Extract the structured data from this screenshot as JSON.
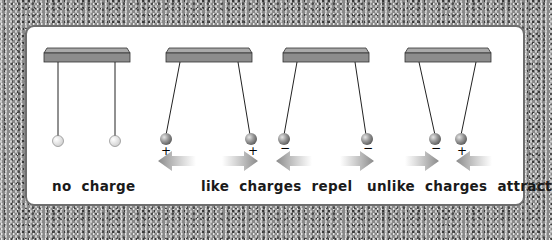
{
  "diagram": {
    "panels": [
      {
        "id": "no-charge",
        "caption": "no charge",
        "balls": [
          {
            "charge": ""
          },
          {
            "charge": ""
          }
        ],
        "arrows": "none"
      },
      {
        "id": "like-charges",
        "balls": [
          {
            "charge": "+"
          },
          {
            "charge": "+"
          }
        ],
        "arrows": "outward"
      },
      {
        "id": "like-charges-negative",
        "balls": [
          {
            "charge": "−"
          },
          {
            "charge": "−"
          }
        ],
        "arrows": "outward"
      },
      {
        "id": "unlike-charges",
        "balls": [
          {
            "charge": "−"
          },
          {
            "charge": "+"
          }
        ],
        "arrows": "inward"
      }
    ],
    "captions": {
      "no_charge": "no charge",
      "like_repel": "like charges repel",
      "unlike_attract": "unlike charges attract"
    },
    "symbols": {
      "plus": "+",
      "minus": "−"
    },
    "colors": {
      "background_texture": "#8a8a8a",
      "panel": "#ffffff",
      "bar": "#8c8c8c",
      "arrow": "#9a9a9a",
      "ball_charged": "#8a8a8a",
      "ball_neutral": "#f0f0f0"
    }
  }
}
